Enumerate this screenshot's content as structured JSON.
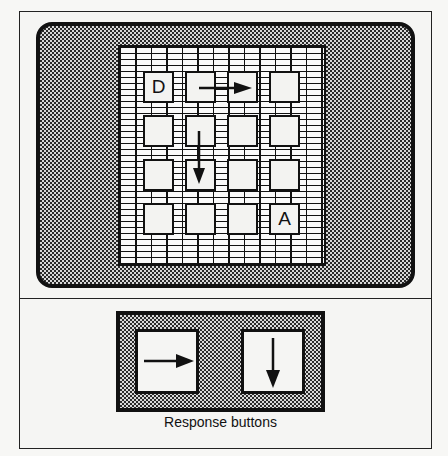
{
  "display": {
    "grid": {
      "rows": 4,
      "cols": 4,
      "cells": [
        [
          "D",
          "",
          "",
          ""
        ],
        [
          "",
          "",
          "",
          ""
        ],
        [
          "",
          "",
          "",
          ""
        ],
        [
          "",
          "",
          "",
          "A"
        ]
      ],
      "arrows": [
        {
          "direction": "right",
          "from_cell": [
            0,
            1
          ],
          "to_cell": [
            0,
            2
          ],
          "icon": "arrow-right-icon"
        },
        {
          "direction": "down",
          "from_cell": [
            1,
            1
          ],
          "to_cell": [
            2,
            1
          ],
          "icon": "arrow-down-icon"
        }
      ]
    },
    "colors": {
      "outline": "#111111",
      "cell_fill": "#f3f3f1",
      "dither_dark": "#2a2a2a"
    }
  },
  "response_panel": {
    "caption": "Response buttons",
    "buttons": [
      {
        "direction": "right",
        "icon": "arrow-right-icon"
      },
      {
        "direction": "down",
        "icon": "arrow-down-icon"
      }
    ]
  }
}
